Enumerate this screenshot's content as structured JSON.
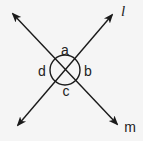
{
  "diagram": {
    "lines": [
      {
        "name": "l",
        "label": "l"
      },
      {
        "name": "m",
        "label": "m"
      }
    ],
    "angles": [
      {
        "name": "a",
        "label": "a",
        "position": "top"
      },
      {
        "name": "b",
        "label": "b",
        "position": "right"
      },
      {
        "name": "c",
        "label": "c",
        "position": "bottom"
      },
      {
        "name": "d",
        "label": "d",
        "position": "left"
      }
    ],
    "colors": {
      "stroke": "#1a1a1a",
      "background": "#f5f5f5"
    }
  }
}
